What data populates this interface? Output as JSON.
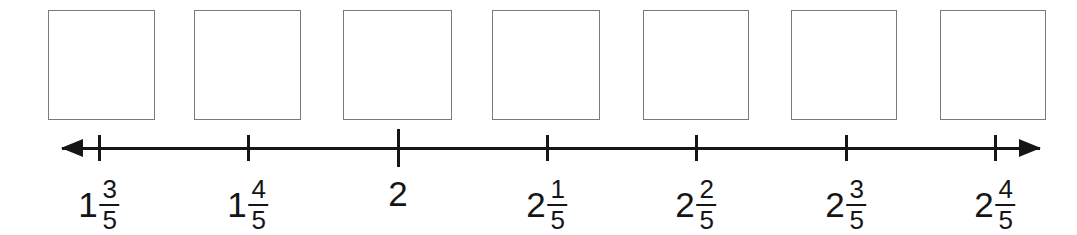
{
  "worksheet": {
    "type": "number-line-exercise",
    "background_color": "#ffffff",
    "ink_color": "#151515",
    "box_border_color": "#7a7a7a"
  },
  "answer_boxes": [
    {
      "id": "answer-box-1",
      "value": "",
      "x": 48,
      "y": 10,
      "width": 107,
      "height": 110
    },
    {
      "id": "answer-box-2",
      "value": "",
      "x": 194,
      "y": 10,
      "width": 107,
      "height": 110
    },
    {
      "id": "answer-box-3",
      "value": "",
      "x": 343,
      "y": 10,
      "width": 109,
      "height": 110
    },
    {
      "id": "answer-box-4",
      "value": "",
      "x": 492,
      "y": 10,
      "width": 108,
      "height": 110
    },
    {
      "id": "answer-box-5",
      "value": "",
      "x": 643,
      "y": 10,
      "width": 106,
      "height": 110
    },
    {
      "id": "answer-box-6",
      "value": "",
      "x": 791,
      "y": 10,
      "width": 106,
      "height": 110
    },
    {
      "id": "answer-box-7",
      "value": "",
      "x": 940,
      "y": 10,
      "width": 106,
      "height": 110
    }
  ],
  "number_line": {
    "axis": {
      "x_start": 62,
      "x_end": 1040,
      "y": 148
    },
    "left_arrow": "arrow-left",
    "right_arrow": "arrow-right",
    "tick_positions": [
      99,
      248,
      398,
      547,
      696,
      846,
      995
    ],
    "ticks": [
      {
        "x": 99,
        "height": 26,
        "emphasis": false
      },
      {
        "x": 248,
        "height": 26,
        "emphasis": false
      },
      {
        "x": 398,
        "height": 38,
        "emphasis": true
      },
      {
        "x": 547,
        "height": 26,
        "emphasis": false
      },
      {
        "x": 696,
        "height": 26,
        "emphasis": false
      },
      {
        "x": 846,
        "height": 26,
        "emphasis": false
      },
      {
        "x": 995,
        "height": 26,
        "emphasis": false
      }
    ]
  },
  "labels": [
    {
      "x": 99,
      "whole": "1",
      "numerator": "3",
      "denominator": "5",
      "text": "1 3/5"
    },
    {
      "x": 248,
      "whole": "1",
      "numerator": "4",
      "denominator": "5",
      "text": "1 4/5"
    },
    {
      "x": 398,
      "whole": "2",
      "numerator": "",
      "denominator": "",
      "text": "2"
    },
    {
      "x": 547,
      "whole": "2",
      "numerator": "1",
      "denominator": "5",
      "text": "2 1/5"
    },
    {
      "x": 696,
      "whole": "2",
      "numerator": "2",
      "denominator": "5",
      "text": "2 2/5"
    },
    {
      "x": 846,
      "whole": "2",
      "numerator": "3",
      "denominator": "5",
      "text": "2 3/5"
    },
    {
      "x": 995,
      "whole": "2",
      "numerator": "4",
      "denominator": "5",
      "text": "2 4/5"
    }
  ],
  "chart_data": {
    "type": "line",
    "title": "",
    "xlabel": "",
    "ylabel": "",
    "grid": false,
    "legend": null,
    "axis_orientation": "horizontal",
    "arrows_both_ends": true,
    "tick_labels": [
      "1 3/5",
      "1 4/5",
      "2",
      "2 1/5",
      "2 2/5",
      "2 3/5",
      "2 4/5"
    ],
    "tick_values": [
      1.6,
      1.8,
      2.0,
      2.2,
      2.4,
      2.6,
      2.8
    ],
    "tick_interval": 0.2,
    "xlim": [
      1.55,
      2.85
    ],
    "blank_boxes_above_ticks": 7
  }
}
